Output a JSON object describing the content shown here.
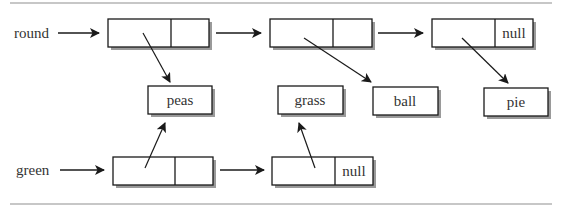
{
  "diagram": {
    "type": "linked-list-sharing",
    "lists": [
      {
        "name": "round",
        "nodes": [
          {
            "points_to": "peas",
            "next": "node"
          },
          {
            "points_to": "ball",
            "next": "node"
          },
          {
            "points_to": "pie",
            "next": "null"
          }
        ]
      },
      {
        "name": "green",
        "nodes": [
          {
            "points_to": "peas",
            "next": "node"
          },
          {
            "points_to": "grass",
            "next": "null"
          }
        ]
      }
    ],
    "values": [
      "peas",
      "grass",
      "ball",
      "pie"
    ],
    "labels": {
      "round": "round",
      "green": "green",
      "null_round": "null",
      "null_green": "null",
      "peas": "peas",
      "grass": "grass",
      "ball": "ball",
      "pie": "pie"
    },
    "colors": {
      "stroke": "#1a1a1a",
      "shadow": "#9a9a9a",
      "rule": "#b5b5b5",
      "text": "#333333"
    }
  }
}
